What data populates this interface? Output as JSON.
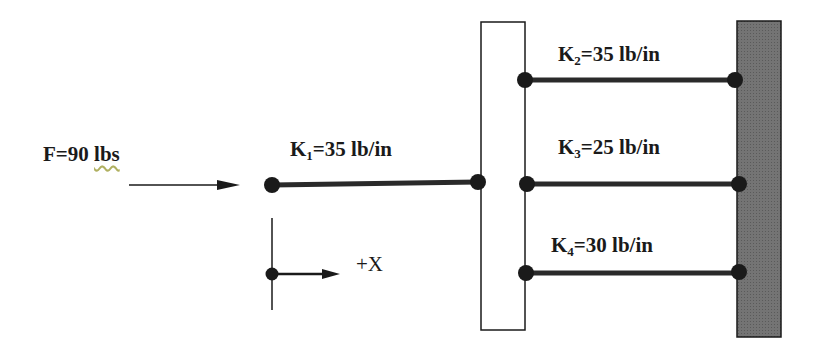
{
  "force": {
    "label": "F=90 ",
    "unit": "lbs"
  },
  "axis": {
    "label": "+X"
  },
  "springs": [
    {
      "k": "K",
      "sub": "1",
      "value": "=35 lb/in"
    },
    {
      "k": "K",
      "sub": "2",
      "value": "=35 lb/in"
    },
    {
      "k": "K",
      "sub": "3",
      "value": "=25 lb/in"
    },
    {
      "k": "K",
      "sub": "4",
      "value": "=30 lb/in"
    }
  ],
  "colors": {
    "line": "#1a1a1a",
    "wall": "#6e6e6e",
    "block": "#ffffff"
  }
}
